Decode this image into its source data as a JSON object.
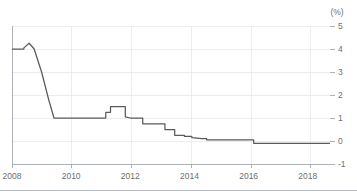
{
  "chart_data": {
    "type": "line",
    "title": "",
    "subtitle": "",
    "xlabel": "",
    "ylabel": "",
    "unit_label": "(%)",
    "xlim": [
      2008.0,
      2018.75
    ],
    "ylim": [
      -1,
      5
    ],
    "x_ticks": [
      2008,
      2010,
      2012,
      2014,
      2016,
      2018
    ],
    "x_tick_labels": [
      "2008",
      "2010",
      "2012",
      "2014",
      "2016",
      "2018"
    ],
    "y_ticks": [
      -1,
      0,
      1,
      2,
      3,
      4,
      5
    ],
    "y_tick_labels": [
      "-1",
      "0",
      "1",
      "2",
      "3",
      "4",
      "5"
    ],
    "y_axis_side": "right",
    "grid": true,
    "grid_axis": "both",
    "legend": false,
    "legend_position": "none",
    "line_color": "#5a5a5a",
    "grid_color": "#e3e6ea",
    "axis_color": "#9aa0a6",
    "text_color": "#6e6e6e",
    "series": [
      {
        "name": "Policy rate",
        "step": true,
        "x": [
          2008.0,
          2008.4,
          2008.4,
          2008.58,
          2008.58,
          2008.75,
          2009.0,
          2009.25,
          2009.42,
          2009.42,
          2010.0,
          2010.5,
          2011.0,
          2011.17,
          2011.17,
          2011.33,
          2011.33,
          2011.5,
          2011.5,
          2011.83,
          2011.83,
          2012.0,
          2012.0,
          2012.42,
          2012.42,
          2012.75,
          2013.0,
          2013.17,
          2013.17,
          2013.5,
          2013.5,
          2013.83,
          2013.83,
          2014.08,
          2014.08,
          2014.42,
          2014.58,
          2014.58,
          2014.83,
          2015.25,
          2015.83,
          2016.17,
          2016.17,
          2017.0,
          2018.0,
          2018.75
        ],
        "y": [
          4.0,
          4.0,
          4.05,
          4.25,
          4.25,
          4.0,
          3.0,
          1.75,
          1.0,
          1.0,
          1.0,
          1.0,
          1.0,
          1.0,
          1.25,
          1.25,
          1.5,
          1.5,
          1.5,
          1.5,
          1.05,
          1.0,
          1.0,
          1.0,
          0.75,
          0.75,
          0.75,
          0.75,
          0.5,
          0.5,
          0.25,
          0.25,
          0.2,
          0.2,
          0.15,
          0.1,
          0.1,
          0.05,
          0.05,
          0.05,
          0.05,
          0.05,
          -0.1,
          -0.1,
          -0.1,
          -0.1
        ],
        "values_description": "Central bank policy interest rate, percent, 2008 to 2018"
      }
    ]
  }
}
